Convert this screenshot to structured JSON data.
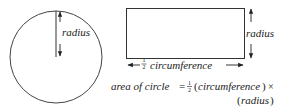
{
  "figure": {
    "circle": {
      "radius_label": "radius"
    },
    "rectangle": {
      "height_label": "radius",
      "width_label_fraction_num": "1",
      "width_label_fraction_den": "2",
      "width_label": "circumference"
    },
    "formula": {
      "lhs": "area of circle",
      "equals": "=",
      "frac_num": "1",
      "frac_den": "2",
      "paren_left": "(",
      "term1": "circumference",
      "paren_right": ")",
      "times": "×",
      "line2_paren_left": "(",
      "term2": "radius",
      "line2_paren_right": ")"
    },
    "colors": {
      "stroke": "#333333",
      "text": "#222222"
    }
  }
}
